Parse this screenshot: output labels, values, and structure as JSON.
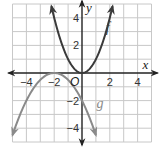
{
  "chart_data": {
    "type": "line",
    "title": "",
    "xlabel": "x",
    "ylabel": "y",
    "xlim": [
      -5,
      5
    ],
    "ylim": [
      -5,
      5
    ],
    "grid": true,
    "origin_label": "O",
    "x_ticks": [
      {
        "value": -4,
        "label": "−4"
      },
      {
        "value": -2,
        "label": "−2"
      },
      {
        "value": 2,
        "label": "2"
      },
      {
        "value": 4,
        "label": "4"
      }
    ],
    "y_ticks": [
      {
        "value": 4,
        "label": "4"
      },
      {
        "value": 2,
        "label": "2"
      },
      {
        "value": -2,
        "label": "−2"
      },
      {
        "value": -4,
        "label": "−4"
      }
    ],
    "series": [
      {
        "name": "f",
        "label": "f",
        "expression": "x^2",
        "coefficients": {
          "a": 1,
          "h": 0,
          "k": 0
        },
        "domain": [
          -2.2,
          2.2
        ],
        "label_at": [
          1.7,
          3.0
        ],
        "color": "#3a3a3a"
      },
      {
        "name": "g",
        "label": "g",
        "expression": "-0.5(x+2)^2",
        "coefficients": {
          "a": -0.5,
          "h": -2,
          "k": 0
        },
        "domain": [
          -5,
          1
        ],
        "label_at": [
          1.05,
          -2.5
        ],
        "color": "#8a8a8a"
      }
    ],
    "colors": {
      "grid": "#c8c8c8",
      "axis": "#222222"
    }
  }
}
